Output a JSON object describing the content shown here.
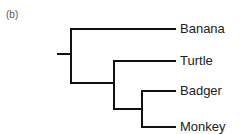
{
  "figure": {
    "panel_label": "(b)",
    "type": "phylogenetic-tree",
    "line_color": "#111111",
    "leaves": [
      {
        "label": "Banana",
        "y": 29
      },
      {
        "label": "Turtle",
        "y": 61
      },
      {
        "label": "Badger",
        "y": 91
      },
      {
        "label": "Monkey",
        "y": 127
      }
    ],
    "topology": "(Banana,(Turtle,(Badger,Monkey)))"
  }
}
